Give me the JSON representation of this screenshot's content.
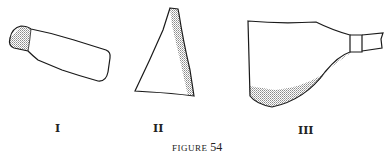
{
  "figure": {
    "caption_prefix": "FIGURE",
    "caption_number": "54",
    "items": [
      {
        "label": "I",
        "description": "elongated tubular fragment, shaded band at left end"
      },
      {
        "label": "II",
        "description": "triangular fragment, shaded along right edge"
      },
      {
        "label": "III",
        "description": "vessel profile with neck and spout, shaded curved base"
      }
    ]
  },
  "colors": {
    "stroke": "#1a1a1a",
    "shade": "#9a9a9a",
    "background": "#ffffff"
  }
}
